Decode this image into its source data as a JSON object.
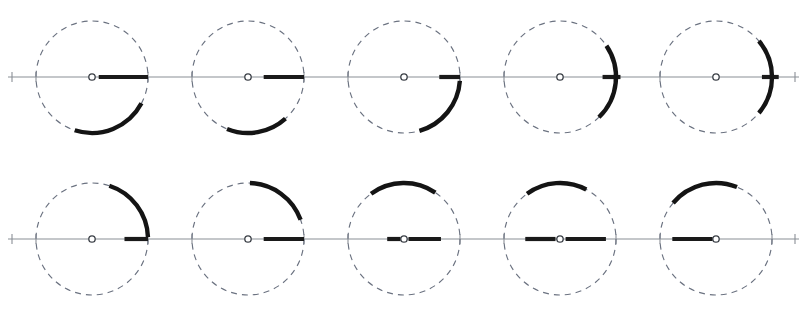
{
  "figure": {
    "width": 807,
    "height": 320,
    "background_color": "#ffffff",
    "rows": 2,
    "columns": 5,
    "panel_count": 10
  },
  "style": {
    "axis_color": "#8a8f96",
    "dashed_circle_color": "#6b7280",
    "marker_color": "#141414",
    "center_dot_fill": "#ffffff",
    "center_dot_stroke": "#3a3f46",
    "dash_pattern": "6 5"
  },
  "geometry": {
    "radius": 56,
    "center_dot_radius": 3.2,
    "tick_half_height": 5,
    "row_center_y": [
      77,
      239
    ],
    "column_center_x": [
      92,
      248,
      404,
      560,
      716
    ],
    "axis_y_row1": 77,
    "axis_y_row2": 239,
    "axis_x_start": 8,
    "axis_x_end": 799
  },
  "chart_data": {
    "type": "scatter",
    "xlabel": "",
    "ylabel": "",
    "panels": [
      {
        "id": "panel-r1c1",
        "row": 1,
        "column": 1,
        "center": [
          92,
          77
        ],
        "radius": 56,
        "radius_segment": {
          "angle_deg": 0,
          "inner_fraction": 0.12,
          "outer_fraction": 1.0
        },
        "arc": {
          "start_deg": -108,
          "end_deg": -28
        },
        "label": ""
      },
      {
        "id": "panel-r1c2",
        "row": 1,
        "column": 2,
        "center": [
          248,
          77
        ],
        "radius": 56,
        "radius_segment": {
          "angle_deg": 0,
          "inner_fraction": 0.28,
          "outer_fraction": 1.0
        },
        "arc": {
          "start_deg": -112,
          "end_deg": -48
        },
        "label": ""
      },
      {
        "id": "panel-r1c3",
        "row": 1,
        "column": 3,
        "center": [
          404,
          77
        ],
        "radius": 56,
        "radius_segment": {
          "angle_deg": 0,
          "inner_fraction": 0.63,
          "outer_fraction": 1.0
        },
        "arc": {
          "start_deg": -74,
          "end_deg": -4
        },
        "label": ""
      },
      {
        "id": "panel-r1c4",
        "row": 1,
        "column": 4,
        "center": [
          560,
          77
        ],
        "radius": 56,
        "radius_segment": {
          "angle_deg": 0,
          "inner_fraction": 0.76,
          "outer_fraction": 1.08
        },
        "arc": {
          "start_deg": -46,
          "end_deg": 34
        },
        "label": ""
      },
      {
        "id": "panel-r1c5",
        "row": 1,
        "column": 5,
        "center": [
          716,
          77
        ],
        "radius": 56,
        "radius_segment": {
          "angle_deg": 0,
          "inner_fraction": 0.82,
          "outer_fraction": 1.12
        },
        "arc": {
          "start_deg": -40,
          "end_deg": 40
        },
        "label": ""
      },
      {
        "id": "panel-r2c1",
        "row": 2,
        "column": 1,
        "center": [
          92,
          239
        ],
        "radius": 56,
        "radius_segment": {
          "angle_deg": 0,
          "inner_fraction": 0.58,
          "outer_fraction": 1.0
        },
        "arc": {
          "start_deg": 2,
          "end_deg": 72
        },
        "label": ""
      },
      {
        "id": "panel-r2c2",
        "row": 2,
        "column": 2,
        "center": [
          248,
          239
        ],
        "radius": 56,
        "radius_segment": {
          "angle_deg": 0,
          "inner_fraction": 0.28,
          "outer_fraction": 1.0
        },
        "arc": {
          "start_deg": 20,
          "end_deg": 88
        },
        "label": ""
      },
      {
        "id": "panel-r2c3",
        "row": 2,
        "column": 3,
        "center": [
          404,
          239
        ],
        "radius": 56,
        "radius_segment": {
          "angle_deg": 0,
          "inner_fraction": 0.08,
          "outer_fraction": 0.66
        },
        "arc": {
          "start_deg": 56,
          "end_deg": 126
        },
        "label": ""
      },
      {
        "id": "panel-r2c4",
        "row": 2,
        "column": 4,
        "center": [
          560,
          239
        ],
        "radius": 56,
        "radius_segment": {
          "angle_deg": 0,
          "inner_fraction": 0.1,
          "outer_fraction": 0.82
        },
        "arc": {
          "start_deg": 62,
          "end_deg": 126
        },
        "label": ""
      },
      {
        "id": "panel-r2c5",
        "row": 2,
        "column": 5,
        "center": [
          716,
          239
        ],
        "radius": 56,
        "radius_segment": {
          "angle_deg": 180,
          "inner_fraction": 0.06,
          "outer_fraction": 0.78
        },
        "arc": {
          "start_deg": 68,
          "end_deg": 140
        },
        "label": ""
      }
    ],
    "secondary_marks": [
      {
        "id": "panel-r2c3-left-stub",
        "panel": "panel-r2c3",
        "angle_deg": 180,
        "inner_fraction": 0.06,
        "outer_fraction": 0.3
      },
      {
        "id": "panel-r2c4-left-stub",
        "panel": "panel-r2c4",
        "angle_deg": 180,
        "inner_fraction": 0.08,
        "outer_fraction": 0.62
      }
    ]
  }
}
